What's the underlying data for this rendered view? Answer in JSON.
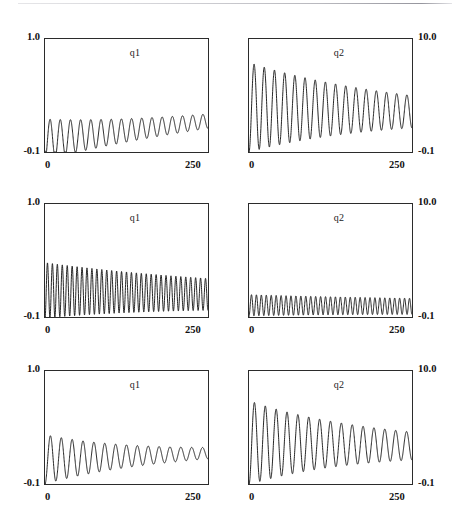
{
  "figure": {
    "title": "",
    "rows": 3,
    "cols": 2,
    "background": "#ffffff",
    "line_color": "#1a1a1a",
    "axis_color": "#2b2b2b"
  },
  "panels": [
    {
      "id": "row1-q1",
      "series_label": "q1",
      "y_top_label": "1.0",
      "y_bottom_label": "-0.1",
      "y_label_side": "left",
      "x_left_label": "0",
      "x_right_label": "250"
    },
    {
      "id": "row1-q2",
      "series_label": "q2",
      "y_top_label": "10.0",
      "y_bottom_label": "-0.1",
      "y_label_side": "right",
      "x_left_label": "0",
      "x_right_label": "250"
    },
    {
      "id": "row2-q1",
      "series_label": "q1",
      "y_top_label": "1.0",
      "y_bottom_label": "-0.1",
      "y_label_side": "left",
      "x_left_label": "0",
      "x_right_label": "250"
    },
    {
      "id": "row2-q2",
      "series_label": "q2",
      "y_top_label": "10.0",
      "y_bottom_label": "-0.1",
      "y_label_side": "right",
      "x_left_label": "0",
      "x_right_label": "250"
    },
    {
      "id": "row3-q1",
      "series_label": "q1",
      "y_top_label": "1.0",
      "y_bottom_label": "-0.1",
      "y_label_side": "left",
      "x_left_label": "0",
      "x_right_label": "250"
    },
    {
      "id": "row3-q2",
      "series_label": "q2",
      "y_top_label": "10.0",
      "y_bottom_label": "-0.1",
      "y_label_side": "right",
      "x_left_label": "0",
      "x_right_label": "250"
    }
  ],
  "chart_data": [
    {
      "type": "line",
      "id": "row1-q1",
      "title": "q1",
      "xlabel": "",
      "ylabel": "q1",
      "xlim": [
        0,
        250
      ],
      "ylim": [
        -0.1,
        1.0
      ],
      "xticks": [
        0,
        250
      ],
      "xticklabels": [
        "0",
        "250"
      ],
      "yticks": [
        -0.1,
        1.0
      ],
      "yticklabels": [
        "-0.1",
        "1.0"
      ],
      "grid": false,
      "legend": "none",
      "waveform": {
        "kind": "damped-oscillation",
        "cycles": 16,
        "baseline_start": 0.02,
        "baseline_end": 0.2,
        "amp_start": 0.2,
        "amp_end": 0.07,
        "decay": 1.35,
        "phase": -1.5707963,
        "start_value": -0.09
      }
    },
    {
      "type": "line",
      "id": "row1-q2",
      "title": "q2",
      "xlabel": "",
      "ylabel": "q2",
      "xlim": [
        0,
        250
      ],
      "ylim": [
        -0.1,
        10.0
      ],
      "xticks": [
        0,
        250
      ],
      "xticklabels": [
        "0",
        "250"
      ],
      "yticks": [
        -0.1,
        10.0
      ],
      "yticklabels": [
        "-0.1",
        "10.0"
      ],
      "grid": false,
      "legend": "none",
      "waveform": {
        "kind": "damped-oscillation",
        "cycles": 16,
        "baseline_start": 3.9,
        "baseline_end": 3.5,
        "amp_start": 4.0,
        "amp_end": 1.45,
        "decay": 1.15,
        "phase": -1.5707963,
        "start_value": -0.08
      }
    },
    {
      "type": "line",
      "id": "row2-q1",
      "title": "q1",
      "xlabel": "",
      "ylabel": "q1",
      "xlim": [
        0,
        250
      ],
      "ylim": [
        -0.1,
        1.0
      ],
      "xticks": [
        0,
        250
      ],
      "xticklabels": [
        "0",
        "250"
      ],
      "yticks": [
        -0.1,
        1.0
      ],
      "yticklabels": [
        "-0.1",
        "1.0"
      ],
      "grid": false,
      "legend": "none",
      "waveform": {
        "kind": "damped-oscillation",
        "cycles": 33,
        "baseline_start": 0.16,
        "baseline_end": 0.12,
        "amp_start": 0.27,
        "amp_end": 0.155,
        "decay": 1.0,
        "phase": -1.5707963,
        "start_value": -0.09
      }
    },
    {
      "type": "line",
      "id": "row2-q2",
      "title": "q2",
      "xlabel": "",
      "ylabel": "q2",
      "xlim": [
        0,
        250
      ],
      "ylim": [
        -0.1,
        10.0
      ],
      "xticks": [
        0,
        250
      ],
      "xticklabels": [
        "0",
        "250"
      ],
      "yticks": [
        -0.1,
        10.0
      ],
      "yticklabels": [
        "-0.1",
        "10.0"
      ],
      "grid": false,
      "legend": "none",
      "waveform": {
        "kind": "damped-oscillation",
        "cycles": 33,
        "baseline_start": 0.95,
        "baseline_end": 0.85,
        "amp_start": 0.95,
        "amp_end": 0.72,
        "decay": 0.9,
        "phase": -1.5707963,
        "start_value": -0.08
      }
    },
    {
      "type": "line",
      "id": "row3-q1",
      "title": "q1",
      "xlabel": "",
      "ylabel": "q1",
      "xlim": [
        0,
        250
      ],
      "ylim": [
        -0.1,
        1.0
      ],
      "xticks": [
        0,
        250
      ],
      "xticklabels": [
        "0",
        "250"
      ],
      "yticks": [
        -0.1,
        1.0
      ],
      "yticklabels": [
        "-0.1",
        "1.0"
      ],
      "grid": false,
      "legend": "none",
      "waveform": {
        "kind": "damped-oscillation",
        "cycles": 15,
        "baseline_start": 0.14,
        "baseline_end": 0.2,
        "amp_start": 0.24,
        "amp_end": 0.055,
        "decay": 1.7,
        "phase": -1.5707963,
        "start_value": -0.09
      }
    },
    {
      "type": "line",
      "id": "row3-q2",
      "title": "q2",
      "xlabel": "",
      "ylabel": "q2",
      "xlim": [
        0,
        250
      ],
      "ylim": [
        -0.1,
        10.0
      ],
      "xticks": [
        0,
        250
      ],
      "xticklabels": [
        "0",
        "250"
      ],
      "yticks": [
        -0.1,
        10.0
      ],
      "yticklabels": [
        "-0.1",
        "10.0"
      ],
      "grid": false,
      "legend": "none",
      "waveform": {
        "kind": "damped-oscillation",
        "cycles": 15,
        "baseline_start": 3.6,
        "baseline_end": 3.3,
        "amp_start": 3.75,
        "amp_end": 1.25,
        "decay": 1.45,
        "phase": -1.5707963,
        "start_value": -0.08
      }
    }
  ]
}
